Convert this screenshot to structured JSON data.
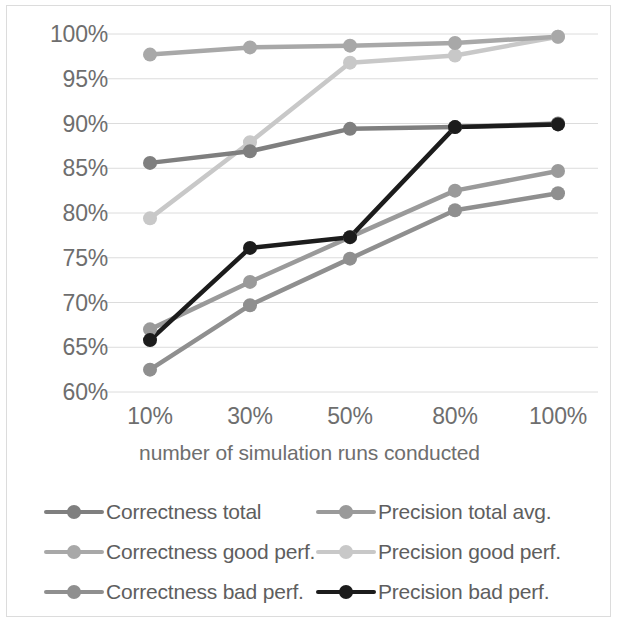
{
  "chart_data": {
    "type": "line",
    "title": "",
    "xlabel": "number of simulation runs conducted",
    "ylabel": "",
    "categories": [
      "10%",
      "30%",
      "50%",
      "80%",
      "100%"
    ],
    "ylim": [
      60,
      100
    ],
    "yticks": [
      "60%",
      "65%",
      "70%",
      "75%",
      "80%",
      "85%",
      "90%",
      "95%",
      "100%"
    ],
    "ytick_values": [
      60,
      65,
      70,
      75,
      80,
      85,
      90,
      95,
      100
    ],
    "grid": true,
    "legend_position": "bottom",
    "legend_columns": 2,
    "series": [
      {
        "name": "Correctness total",
        "color": "#7f7f7f",
        "values": [
          85.6,
          86.9,
          89.4,
          89.6,
          90.0
        ]
      },
      {
        "name": "Precision total avg.",
        "color": "#9a9a9a",
        "values": [
          67.0,
          72.3,
          77.3,
          82.5,
          84.7
        ]
      },
      {
        "name": "Correctness good perf.",
        "color": "#a8a8a8",
        "values": [
          97.7,
          98.5,
          98.7,
          99.0,
          99.7
        ]
      },
      {
        "name": "Precision good perf.",
        "color": "#c8c8c8",
        "values": [
          79.4,
          87.9,
          96.8,
          97.6,
          99.7
        ]
      },
      {
        "name": "Correctness bad perf.",
        "color": "#8f8f8f",
        "values": [
          62.5,
          69.7,
          74.9,
          80.3,
          82.2
        ]
      },
      {
        "name": "Precision bad perf.",
        "color": "#1c1c1c",
        "values": [
          65.8,
          76.1,
          77.3,
          89.6,
          89.9
        ]
      }
    ]
  },
  "axis": {
    "x_title": "number of simulation runs conducted"
  },
  "colors": {
    "tick_text": "#6e6e6e",
    "legend_text": "#5e5e5e",
    "gridline": "#dcdcdc",
    "background": "#ffffff",
    "frame": "#dcdcdc"
  }
}
